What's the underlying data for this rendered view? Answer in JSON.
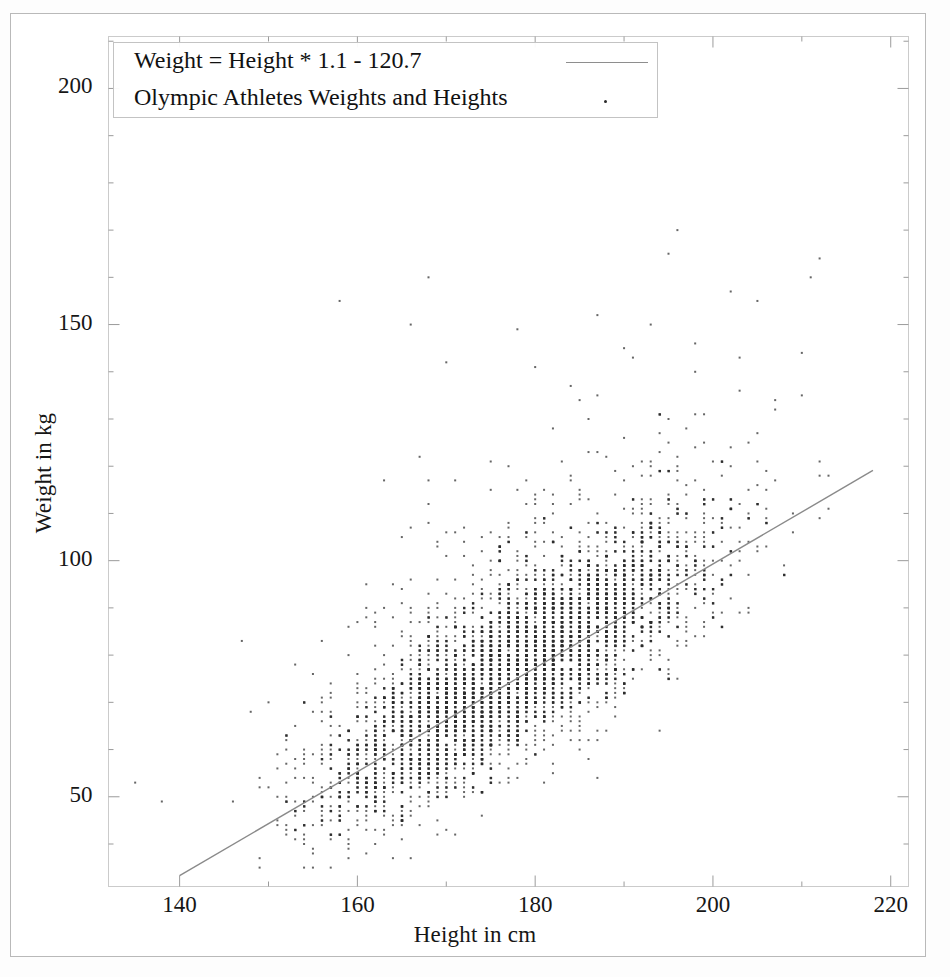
{
  "figure": {
    "background_color": "#ffffff",
    "frame_color": "#c9c9c9",
    "point_color": "#2b2b2b",
    "line_color": "#8a8a8a"
  },
  "legend": {
    "entries": [
      {
        "label": "Weight = Height * 1.1 - 120.7",
        "key": "line"
      },
      {
        "label": "Olympic Athletes Weights and Heights",
        "key": "dot"
      }
    ]
  },
  "chart_data": {
    "type": "scatter",
    "title": "Olympic Athletes Weights and Heights",
    "xlabel": "Height in cm",
    "ylabel": "Weight in kg",
    "xlim": [
      132,
      222
    ],
    "ylim": [
      31,
      211
    ],
    "xticks": [
      140,
      160,
      180,
      200,
      220
    ],
    "yticks": [
      50,
      100,
      150,
      200
    ],
    "xtick_labels": [
      "140",
      "160",
      "180",
      "200",
      "220"
    ],
    "ytick_labels": [
      "50",
      "100",
      "150",
      "200"
    ],
    "x_minor_step": 10,
    "y_minor_step": 10,
    "grid": false,
    "legend_position": "upper-left",
    "series": [
      {
        "name": "Weight = Height * 1.1 - 120.7",
        "type": "line",
        "slope": 1.1,
        "intercept": -120.7,
        "x": [
          140,
          218
        ],
        "y": [
          33.3,
          119.1
        ],
        "color": "#8a8a8a"
      },
      {
        "name": "Olympic Athletes Weights and Heights",
        "type": "scatter",
        "color": "#2b2b2b",
        "marker": "point",
        "marker_size": 2,
        "description": "Dense integer-valued grid of athlete height/weight pairs, correlated along the regression line, with a heavy core between 160-205 cm and 50-120 kg and sparse high-weight outliers up to ~170 kg.",
        "cluster_core": {
          "x_range": [
            160,
            205
          ],
          "y_range": [
            48,
            125
          ]
        },
        "outliers": [
          [
            196,
            170
          ],
          [
            195,
            165
          ],
          [
            168,
            160
          ],
          [
            211,
            160
          ],
          [
            158,
            155
          ],
          [
            205,
            155
          ],
          [
            187,
            152
          ],
          [
            193,
            150
          ],
          [
            166,
            150
          ],
          [
            178,
            149
          ],
          [
            198,
            146
          ],
          [
            190,
            145
          ],
          [
            203,
            143
          ],
          [
            170,
            142
          ],
          [
            180,
            141
          ],
          [
            163,
            117
          ],
          [
            135,
            53
          ],
          [
            138,
            49
          ],
          [
            148,
            68
          ],
          [
            152,
            62
          ]
        ]
      }
    ]
  }
}
